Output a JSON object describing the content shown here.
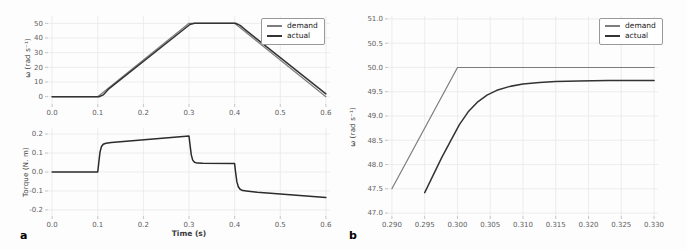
{
  "figure": {
    "panels": {
      "a": {
        "label": "a"
      },
      "b": {
        "label": "b"
      }
    },
    "legend_labels": {
      "demand": "demand",
      "actual": "actual"
    },
    "colors": {
      "demand_line": "#7d7d7d",
      "actual_line": "#333333",
      "torque_line": "#2b2b2b",
      "grid": "#e9e9e9",
      "tick_text": "#5f5f5f",
      "axis_label_text": "#3a3a3a",
      "background": "#fdfdfd"
    }
  },
  "chart_data": [
    {
      "id": "omega_full",
      "type": "line",
      "panel": "a",
      "title": "",
      "xlabel": "",
      "ylabel": "ω (rad s⁻¹)",
      "xlim": [
        0.0,
        0.6
      ],
      "ylim": [
        0,
        50
      ],
      "grid": true,
      "legend": {
        "entries": [
          "demand",
          "actual"
        ],
        "position": "upper right"
      },
      "xticks": {
        "values": [
          0.0,
          0.1,
          0.2,
          0.3,
          0.4,
          0.5,
          0.6
        ],
        "labels": [
          "0.0",
          "0.1",
          "0.2",
          "0.3",
          "0.4",
          "0.5",
          "0.6"
        ]
      },
      "yticks": {
        "values": [
          0,
          10,
          20,
          30,
          40,
          50
        ],
        "labels": [
          "0",
          "10",
          "20",
          "30",
          "40",
          "50"
        ]
      },
      "series": [
        {
          "name": "demand",
          "color": "#7d7d7d",
          "x": [
            0.0,
            0.1,
            0.3,
            0.4,
            0.6
          ],
          "y": [
            0,
            0,
            50,
            50,
            0
          ]
        },
        {
          "name": "actual",
          "color": "#333333",
          "x": [
            0.0,
            0.103,
            0.112,
            0.125,
            0.302,
            0.312,
            0.402,
            0.412,
            0.425,
            0.6
          ],
          "y": [
            0,
            0,
            1.2,
            5.5,
            49.2,
            50.0,
            50.0,
            48.6,
            45.2,
            1.9
          ]
        }
      ]
    },
    {
      "id": "torque_full",
      "type": "line",
      "panel": "a",
      "title": "",
      "xlabel": "Time (s)",
      "ylabel": "Torque (N. m)",
      "xlim": [
        0.0,
        0.6
      ],
      "ylim": [
        -0.2,
        0.2
      ],
      "grid": true,
      "legend": null,
      "xticks": {
        "values": [
          0.0,
          0.1,
          0.2,
          0.3,
          0.4,
          0.5,
          0.6
        ],
        "labels": [
          "0.0",
          "0.1",
          "0.2",
          "0.3",
          "0.4",
          "0.5",
          "0.6"
        ]
      },
      "yticks": {
        "values": [
          -0.2,
          -0.1,
          0.0,
          0.1,
          0.2
        ],
        "labels": [
          "-0.2",
          "-0.1",
          "0.0",
          "0.1",
          "0.2"
        ]
      },
      "series": [
        {
          "name": "torque",
          "color": "#2b2b2b",
          "x": [
            0.0,
            0.1,
            0.102,
            0.105,
            0.108,
            0.112,
            0.118,
            0.13,
            0.3,
            0.302,
            0.305,
            0.308,
            0.312,
            0.318,
            0.33,
            0.4,
            0.402,
            0.405,
            0.408,
            0.412,
            0.418,
            0.43,
            0.45,
            0.5,
            0.55,
            0.6
          ],
          "y": [
            0.0,
            0.0,
            0.045,
            0.105,
            0.133,
            0.146,
            0.152,
            0.156,
            0.19,
            0.148,
            0.09,
            0.063,
            0.051,
            0.047,
            0.046,
            0.045,
            0.002,
            -0.052,
            -0.078,
            -0.091,
            -0.098,
            -0.102,
            -0.107,
            -0.116,
            -0.125,
            -0.134
          ]
        }
      ]
    },
    {
      "id": "omega_zoom",
      "type": "line",
      "panel": "b",
      "title": "",
      "xlabel": "",
      "ylabel": "ω (rad s⁻¹)",
      "xlim": [
        0.29,
        0.33
      ],
      "ylim": [
        47.0,
        51.0
      ],
      "grid": true,
      "legend": {
        "entries": [
          "demand",
          "actual"
        ],
        "position": "upper right"
      },
      "xticks": {
        "values": [
          0.29,
          0.295,
          0.3,
          0.305,
          0.31,
          0.315,
          0.32,
          0.325,
          0.33
        ],
        "labels": [
          "0.290",
          "0.295",
          "0.300",
          "0.305",
          "0.310",
          "0.315",
          "0.320",
          "0.325",
          "0.330"
        ]
      },
      "yticks": {
        "values": [
          47.0,
          47.5,
          48.0,
          48.5,
          49.0,
          49.5,
          50.0,
          50.5,
          51.0
        ],
        "labels": [
          "47.0",
          "47.5",
          "48.0",
          "48.5",
          "49.0",
          "49.5",
          "50.0",
          "50.5",
          "51.0"
        ]
      },
      "series": [
        {
          "name": "demand",
          "color": "#7d7d7d",
          "x": [
            0.29,
            0.3,
            0.33
          ],
          "y": [
            47.5,
            50.0,
            50.0
          ]
        },
        {
          "name": "actual",
          "color": "#333333",
          "x": [
            0.295,
            0.2963,
            0.2976,
            0.299,
            0.3003,
            0.3016,
            0.303,
            0.3045,
            0.306,
            0.308,
            0.31,
            0.3125,
            0.315,
            0.3185,
            0.323,
            0.33
          ],
          "y": [
            47.42,
            47.78,
            48.14,
            48.5,
            48.82,
            49.08,
            49.28,
            49.43,
            49.53,
            49.61,
            49.66,
            49.69,
            49.71,
            49.72,
            49.73,
            49.73
          ]
        }
      ]
    }
  ]
}
